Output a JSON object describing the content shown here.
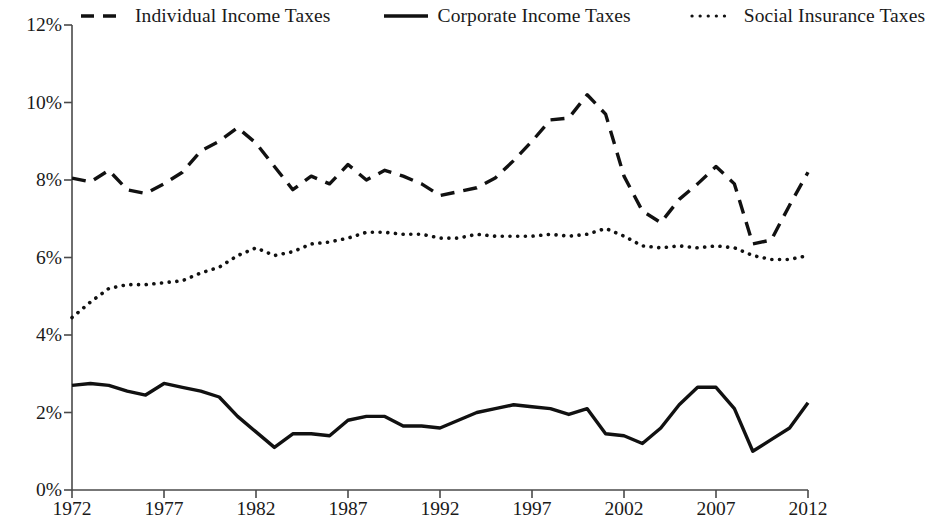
{
  "chart_data": {
    "type": "line",
    "title": "",
    "xlabel": "",
    "ylabel": "",
    "xlim": [
      1972,
      2012
    ],
    "ylim": [
      0,
      12
    ],
    "grid": false,
    "legend_position": "top",
    "y_tick_labels": [
      "12%",
      "10%",
      "8%",
      "6%",
      "4%",
      "2%",
      "0%"
    ],
    "y_tick_values": [
      12,
      10,
      8,
      6,
      4,
      2,
      0
    ],
    "x_tick_labels": [
      "1972",
      "1977",
      "1982",
      "1987",
      "1992",
      "1997",
      "2002",
      "2007",
      "2012"
    ],
    "x_tick_values": [
      1972,
      1977,
      1982,
      1987,
      1992,
      1997,
      2002,
      2007,
      2012
    ],
    "x": [
      1972,
      1973,
      1974,
      1975,
      1976,
      1977,
      1978,
      1979,
      1980,
      1981,
      1982,
      1983,
      1984,
      1985,
      1986,
      1987,
      1988,
      1989,
      1990,
      1991,
      1992,
      1993,
      1994,
      1995,
      1996,
      1997,
      1998,
      1999,
      2000,
      2001,
      2002,
      2003,
      2004,
      2005,
      2006,
      2007,
      2008,
      2009,
      2010,
      2011,
      2012
    ],
    "series": [
      {
        "name": "Individual Income Taxes",
        "style": "dashed",
        "color": "#111111",
        "values": [
          8.05,
          7.95,
          8.25,
          7.75,
          7.65,
          7.9,
          8.2,
          8.75,
          9.0,
          9.35,
          8.95,
          8.35,
          7.75,
          8.1,
          7.9,
          8.4,
          8.0,
          8.25,
          8.1,
          7.9,
          7.6,
          7.7,
          7.8,
          8.05,
          8.5,
          9.0,
          9.55,
          9.6,
          10.2,
          9.7,
          8.1,
          7.2,
          6.9,
          7.5,
          7.9,
          8.35,
          7.9,
          6.35,
          6.45,
          7.35,
          8.2
        ]
      },
      {
        "name": "Corporate Income Taxes",
        "style": "solid",
        "color": "#111111",
        "values": [
          2.7,
          2.75,
          2.7,
          2.55,
          2.45,
          2.75,
          2.65,
          2.55,
          2.4,
          1.9,
          1.5,
          1.1,
          1.45,
          1.45,
          1.4,
          1.8,
          1.9,
          1.9,
          1.65,
          1.65,
          1.6,
          1.8,
          2.0,
          2.1,
          2.2,
          2.15,
          2.1,
          1.95,
          2.1,
          1.45,
          1.4,
          1.2,
          1.6,
          2.2,
          2.65,
          2.65,
          2.1,
          1.0,
          1.3,
          1.6,
          2.25
        ]
      },
      {
        "name": "Social Insurance Taxes",
        "style": "dotted",
        "color": "#111111",
        "values": [
          4.45,
          4.85,
          5.2,
          5.3,
          5.3,
          5.35,
          5.4,
          5.6,
          5.75,
          6.05,
          6.25,
          6.05,
          6.15,
          6.35,
          6.4,
          6.5,
          6.65,
          6.65,
          6.6,
          6.6,
          6.5,
          6.5,
          6.6,
          6.55,
          6.55,
          6.55,
          6.6,
          6.55,
          6.6,
          6.75,
          6.55,
          6.3,
          6.25,
          6.3,
          6.25,
          6.3,
          6.25,
          6.05,
          5.95,
          5.95,
          6.05
        ]
      }
    ]
  },
  "legend": {
    "items": [
      {
        "label": "Individual Income Taxes",
        "style": "dashed"
      },
      {
        "label": "Corporate Income Taxes",
        "style": "solid"
      },
      {
        "label": "Social Insurance Taxes",
        "style": "dotted"
      }
    ]
  }
}
